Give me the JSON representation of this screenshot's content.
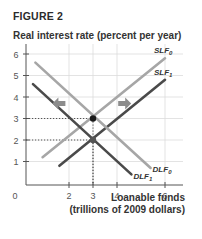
{
  "figure_label": "FIGURE 2",
  "chart_data": {
    "type": "line",
    "title": "FIGURE 2",
    "ylabel": "Real interest rate (percent per year)",
    "xlabel": "Loanable funds",
    "xlabel_sub": "(trillions of 2009 dollars)",
    "origin_label": "0",
    "xlim": [
      0,
      6.5
    ],
    "ylim": [
      0,
      6.3
    ],
    "x_ticks": [
      2,
      3,
      4,
      6
    ],
    "y_ticks": [
      1,
      2,
      3,
      4,
      5,
      6
    ],
    "grid": true,
    "series": [
      {
        "name": "SLF0",
        "label": "SLF",
        "sub": "0",
        "color": "#a6a6a6",
        "points": [
          [
            0.9,
            1.2
          ],
          [
            6.0,
            5.8
          ]
        ]
      },
      {
        "name": "SLF1",
        "label": "SLF",
        "sub": "1",
        "color": "#4a4a4a",
        "points": [
          [
            1.6,
            0.8
          ],
          [
            6.0,
            4.8
          ]
        ]
      },
      {
        "name": "DLF0",
        "label": "DLF",
        "sub": "0",
        "color": "#a6a6a6",
        "points": [
          [
            0.6,
            5.6
          ],
          [
            5.4,
            0.7
          ]
        ]
      },
      {
        "name": "DLF1",
        "label": "DLF",
        "sub": "1",
        "color": "#4a4a4a",
        "points": [
          [
            0.5,
            4.6
          ],
          [
            4.6,
            0.4
          ]
        ]
      }
    ],
    "equilibria": [
      {
        "x": 3,
        "y": 3,
        "color": "#1a1a1a"
      },
      {
        "x": 3,
        "y": 2,
        "color": "#555555"
      }
    ],
    "annotations": [
      {
        "type": "arrow",
        "direction": "left",
        "x": 1.6,
        "y": 3.7,
        "meaning": "demand shift left"
      },
      {
        "type": "arrow",
        "direction": "right",
        "x": 4.3,
        "y": 3.7,
        "meaning": "supply shift right"
      }
    ]
  }
}
